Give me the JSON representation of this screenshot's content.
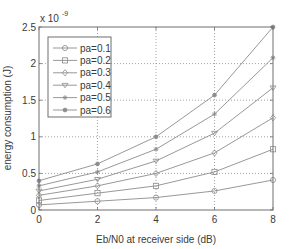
{
  "chart_data": {
    "type": "line",
    "title": "",
    "xlabel": "Eb/N0 at receiver side (dB)",
    "ylabel": "energy consumption (J)",
    "y_exponent_label": "x 10",
    "y_exponent_power": "-9",
    "xlim": [
      0,
      8
    ],
    "ylim": [
      0,
      2.5
    ],
    "y_scale": 1e-09,
    "x_ticks": [
      0,
      2,
      4,
      6,
      8
    ],
    "x_tick_labels": [
      "0",
      "2",
      "4",
      "6",
      "8"
    ],
    "y_ticks": [
      0,
      0.5,
      1,
      1.5,
      2,
      2.5
    ],
    "y_tick_labels": [
      "0",
      "0.5",
      "1",
      "1.5",
      "2",
      "2.5"
    ],
    "grid": true,
    "legend_position": "upper left",
    "x": [
      0,
      2,
      4,
      6,
      8
    ],
    "series": [
      {
        "name": "pa=0.1",
        "marker": "circle",
        "values": [
          0.07,
          0.12,
          0.17,
          0.26,
          0.41
        ]
      },
      {
        "name": "pa=0.2",
        "marker": "square",
        "values": [
          0.13,
          0.23,
          0.33,
          0.52,
          0.83
        ]
      },
      {
        "name": "pa=0.3",
        "marker": "diamond",
        "values": [
          0.2,
          0.33,
          0.5,
          0.78,
          1.26
        ]
      },
      {
        "name": "pa=0.4",
        "marker": "triangle-down",
        "values": [
          0.26,
          0.42,
          0.67,
          1.05,
          1.67
        ]
      },
      {
        "name": "pa=0.5",
        "marker": "star",
        "values": [
          0.33,
          0.52,
          0.83,
          1.31,
          2.08
        ]
      },
      {
        "name": "pa=0.6",
        "marker": "filled-circle",
        "values": [
          0.4,
          0.63,
          1.0,
          1.57,
          2.5
        ]
      }
    ],
    "colors": {
      "line": "#8c8c8c",
      "axis": "#6e6e6e",
      "grid": "#8a8a8a",
      "text": "#3a3a3a"
    }
  }
}
